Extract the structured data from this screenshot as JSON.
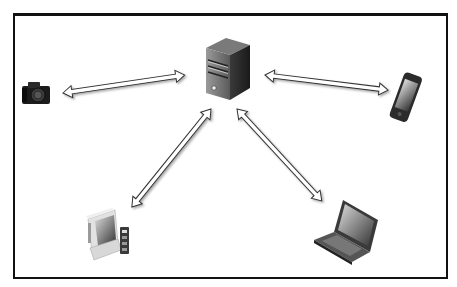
{
  "diagram": {
    "nodes": [
      {
        "id": "server",
        "icon": "server-icon",
        "label": "3rd Party Provider"
      },
      {
        "id": "camera",
        "icon": "camera-icon"
      },
      {
        "id": "phone",
        "icon": "smartphone-icon"
      },
      {
        "id": "desktop",
        "icon": "desktop-computer-icon"
      },
      {
        "id": "laptop",
        "icon": "laptop-icon"
      }
    ],
    "edges": [
      {
        "from": "camera",
        "to": "server",
        "type": "bidirectional-arrow"
      },
      {
        "from": "server",
        "to": "phone",
        "type": "bidirectional-arrow"
      },
      {
        "from": "server",
        "to": "desktop",
        "type": "bidirectional-arrow"
      },
      {
        "from": "server",
        "to": "laptop",
        "type": "bidirectional-arrow"
      }
    ],
    "colors": {
      "border": "#111111",
      "arrow_fill": "#ffffff",
      "arrow_stroke": "#333333"
    }
  }
}
